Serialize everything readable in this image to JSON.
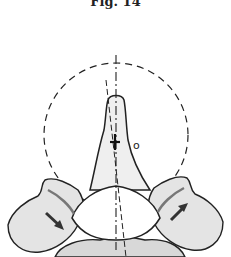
{
  "figure": {
    "caption": "Fig. 14",
    "labels": {
      "center_point": "o"
    },
    "colors": {
      "line": "#222222",
      "shade": "#cfcfcf",
      "arrow": "#333333"
    }
  }
}
